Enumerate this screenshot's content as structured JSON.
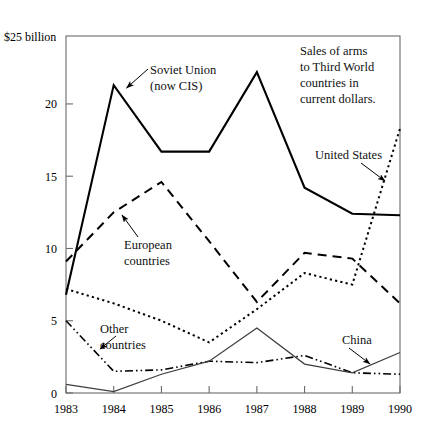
{
  "chart_data": {
    "type": "line",
    "title": "",
    "caption": "Sales of arms to Third World countries in current dollars.",
    "unit_label": "$25 billion",
    "xlabel": "",
    "ylabel": "",
    "x": [
      "1983",
      "1984",
      "1985",
      "1986",
      "1987",
      "1988",
      "1989",
      "1990"
    ],
    "categories": [
      "1983",
      "1984",
      "1985",
      "1986",
      "1987",
      "1988",
      "1989",
      "1990"
    ],
    "yticks": [
      "0",
      "5",
      "10",
      "15",
      "20"
    ],
    "ytick_values": [
      0,
      5,
      10,
      15,
      20
    ],
    "ylim": [
      0,
      24.7
    ],
    "xlim": [
      "1983",
      "1990"
    ],
    "grid": false,
    "legend_position": "inline-annotations",
    "series": [
      {
        "name": "Soviet Union (now CIS)",
        "label": "Soviet Union",
        "label_line2": "(now CIS)",
        "style": "solid-thick",
        "color": "#000000",
        "values": [
          6.8,
          21.3,
          16.7,
          16.7,
          22.2,
          14.2,
          12.4,
          12.3
        ]
      },
      {
        "name": "European countries",
        "label": "European",
        "label_line2": "countries",
        "style": "dashed",
        "color": "#000000",
        "values": [
          9.1,
          12.5,
          14.6,
          10.5,
          6.3,
          9.7,
          9.3,
          6.2
        ]
      },
      {
        "name": "United States",
        "label": "United States",
        "label_line2": "",
        "style": "dotted",
        "color": "#000000",
        "values": [
          7.2,
          6.2,
          5.0,
          3.5,
          5.8,
          8.3,
          7.5,
          18.3
        ]
      },
      {
        "name": "Other countries",
        "label": "Other",
        "label_line2": "countries",
        "style": "dash-dot",
        "color": "#000000",
        "values": [
          5.0,
          1.5,
          1.6,
          2.2,
          2.1,
          2.6,
          1.4,
          1.3
        ]
      },
      {
        "name": "China",
        "label": "China",
        "label_line2": "",
        "style": "solid-thin",
        "color": "#3d3d3d",
        "values": [
          0.6,
          0.1,
          1.3,
          2.2,
          4.5,
          2.0,
          1.4,
          2.8
        ]
      }
    ]
  },
  "annotations": {
    "soviet": {
      "line1": "Soviet Union",
      "line2": "(now CIS)"
    },
    "european": {
      "line1": "European",
      "line2": "countries"
    },
    "united_states": {
      "line1": "United States"
    },
    "other": {
      "line1": "Other",
      "line2": "countries"
    },
    "china": {
      "line1": "China"
    },
    "caption": {
      "line1": "Sales of arms",
      "line2": "to Third World",
      "line3": "countries in",
      "line4": "current dollars."
    }
  },
  "axes": {
    "unit_label": "$25 billion",
    "y_ticks": [
      "20",
      "15",
      "10",
      "5",
      "0"
    ],
    "x_ticks": [
      "1983",
      "1984",
      "1985",
      "1986",
      "1987",
      "1988",
      "1989",
      "1990"
    ]
  }
}
